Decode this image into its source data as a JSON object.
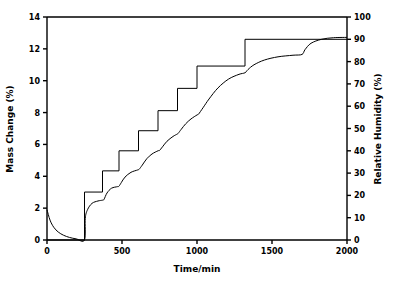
{
  "chart_data": {
    "type": "line",
    "title": "",
    "xlabel": "Time/min",
    "ylabel": "Mass Change (%)",
    "y2label": "Relative Humidity (%)",
    "xlim": [
      0,
      2000
    ],
    "ylim": [
      0,
      14
    ],
    "y2lim": [
      0,
      100
    ],
    "xticks": [
      0,
      500,
      1000,
      1500,
      2000
    ],
    "yticks": [
      0,
      2,
      4,
      6,
      8,
      10,
      12,
      14
    ],
    "y2ticks": [
      0,
      10,
      20,
      30,
      40,
      50,
      60,
      70,
      80,
      90,
      100
    ],
    "grid": false,
    "legend": "none",
    "line_color": "#000000",
    "series": [
      {
        "name": "Relative Humidity",
        "axis": "right",
        "style": "step",
        "x": [
          0,
          250,
          250,
          370,
          370,
          480,
          480,
          610,
          610,
          740,
          740,
          870,
          870,
          1000,
          1000,
          1320,
          1320,
          1700,
          1700,
          2000
        ],
        "values": [
          0,
          0,
          21.5,
          21.5,
          31,
          31,
          40,
          40,
          49,
          49,
          58,
          58,
          68,
          68,
          78,
          78,
          90,
          90,
          90,
          90
        ]
      },
      {
        "name": "Mass Change",
        "axis": "left",
        "style": "smooth",
        "x": [
          0,
          20,
          45,
          75,
          110,
          150,
          195,
          250,
          255,
          270,
          300,
          340,
          370,
          380,
          400,
          430,
          470,
          480,
          495,
          520,
          560,
          605,
          615,
          635,
          665,
          700,
          740,
          750,
          770,
          800,
          840,
          868,
          875,
          895,
          925,
          960,
          1000,
          1010,
          1040,
          1080,
          1140,
          1210,
          1280,
          1320,
          1340,
          1380,
          1450,
          1540,
          1640,
          1700,
          1720,
          1760,
          1830,
          1910,
          2000
        ],
        "values": [
          1.9,
          1.25,
          0.8,
          0.5,
          0.3,
          0.16,
          0.07,
          0.0,
          1.35,
          1.9,
          2.3,
          2.45,
          2.5,
          2.55,
          2.95,
          3.25,
          3.35,
          3.38,
          3.6,
          3.95,
          4.25,
          4.4,
          4.45,
          4.7,
          5.1,
          5.4,
          5.6,
          5.62,
          5.85,
          6.2,
          6.5,
          6.65,
          6.7,
          6.95,
          7.3,
          7.6,
          7.85,
          7.9,
          8.3,
          8.85,
          9.55,
          10.1,
          10.4,
          10.5,
          10.7,
          11.0,
          11.3,
          11.5,
          11.6,
          11.65,
          11.95,
          12.35,
          12.6,
          12.7,
          12.72
        ]
      }
    ]
  }
}
